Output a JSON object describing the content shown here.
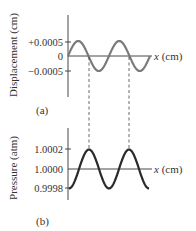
{
  "panel_a": {
    "tag": "(a)",
    "ylabel": "Displacement (cm)",
    "xlabel": "x (cm)",
    "xlabel_var": "x",
    "xlabel_unit": " (cm)",
    "ticks": [
      "+0.0005",
      "0",
      "−0.0005"
    ],
    "curve_color": "#7a7a7a",
    "phase": "sine"
  },
  "panel_b": {
    "tag": "(b)",
    "ylabel": "Pressure (atm)",
    "xlabel": "x (cm)",
    "xlabel_var": "x",
    "xlabel_unit": " (cm)",
    "ticks": [
      "1.0002",
      "1.0000",
      "0.9998"
    ],
    "curve_color": "#2a2a2a",
    "phase": "negative-cosine"
  },
  "cycles": 2,
  "dashed_line_note": "Displacement zero crossings align with pressure maxima"
}
